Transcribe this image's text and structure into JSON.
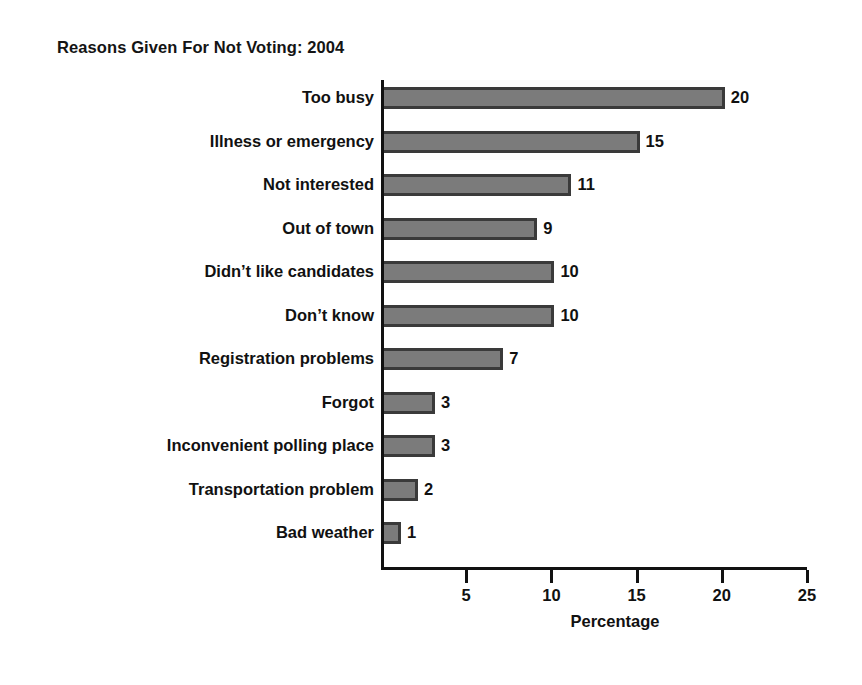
{
  "chart_data": {
    "type": "bar",
    "orientation": "horizontal",
    "title": "Reasons Given For Not Voting: 2004",
    "xlabel": "Percentage",
    "ylabel": "",
    "xlim": [
      0,
      25
    ],
    "xticks": [
      5,
      10,
      15,
      20,
      25
    ],
    "grid": false,
    "legend": null,
    "bar_color": "#7b7b7b",
    "bar_edge_color": "#3a3a3a",
    "categories": [
      "Too busy",
      "Illness or emergency",
      "Not interested",
      "Out of town",
      "Didn’t like candidates",
      "Don’t know",
      "Registration problems",
      "Forgot",
      "Inconvenient polling place",
      "Transportation problem",
      "Bad weather"
    ],
    "values": [
      20,
      15,
      11,
      9,
      10,
      10,
      7,
      3,
      3,
      2,
      1
    ],
    "value_labels": [
      "20",
      "15",
      "11",
      "9",
      "10",
      "10",
      "7",
      "3",
      "3",
      "2",
      "1"
    ],
    "tick_labels": [
      "5",
      "10",
      "15",
      "20",
      "25"
    ]
  }
}
